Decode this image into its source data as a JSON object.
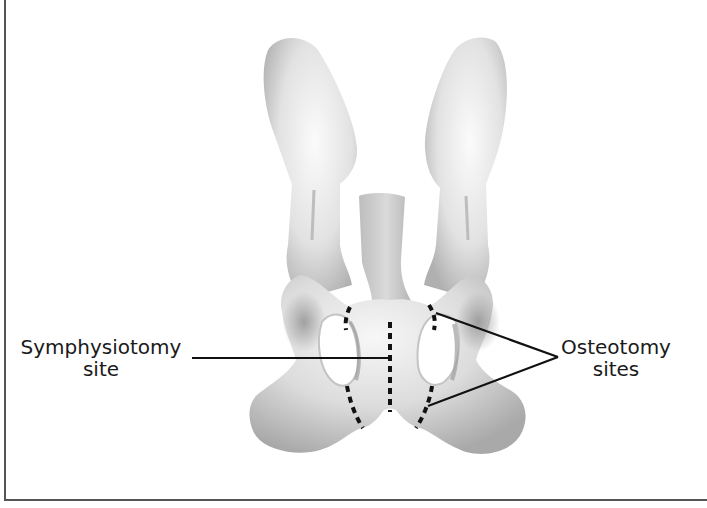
{
  "figure": {
    "type": "anatomical-diagram",
    "colors": {
      "bone_light": "#f4f4f4",
      "bone_mid": "#d6d6d6",
      "bone_dark": "#9a9a9a",
      "cut_line": "#111111",
      "leader_line": "#111111",
      "frame": "#555555",
      "text": "#1a1a1a"
    }
  },
  "labels": {
    "symphysiotomy": {
      "line1": "Symphysiotomy",
      "line2": "site"
    },
    "osteotomy": {
      "line1": "Osteotomy",
      "line2": "sites"
    }
  },
  "annotations": [
    {
      "name": "symphysiotomy-site",
      "style": "dashed",
      "orientation": "vertical midline"
    },
    {
      "name": "osteotomy-site-left-upper",
      "style": "dashed"
    },
    {
      "name": "osteotomy-site-left-lower",
      "style": "dashed"
    },
    {
      "name": "osteotomy-site-right-upper",
      "style": "dashed"
    },
    {
      "name": "osteotomy-site-right-lower",
      "style": "dashed"
    }
  ]
}
